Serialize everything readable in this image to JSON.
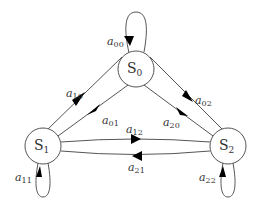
{
  "diagram": {
    "title": "",
    "colors": {
      "edge": "#555555",
      "arrowhead": "#000000",
      "label": "#333333",
      "background": "#ffffff"
    },
    "nodes": [
      {
        "id": "S0",
        "base": "S",
        "sub": "0",
        "cx": 136,
        "cy": 69,
        "r": 18
      },
      {
        "id": "S1",
        "base": "S",
        "sub": "1",
        "cx": 43,
        "cy": 146,
        "r": 18
      },
      {
        "id": "S2",
        "base": "S",
        "sub": "2",
        "cx": 228,
        "cy": 146,
        "r": 18
      }
    ],
    "edges": [
      {
        "id": "a00",
        "from": "S0",
        "to": "S0",
        "label_base": "a",
        "label_sub": "00",
        "type": "self-loop"
      },
      {
        "id": "a01",
        "from": "S0",
        "to": "S1",
        "label_base": "a",
        "label_sub": "01",
        "type": "straight"
      },
      {
        "id": "a10",
        "from": "S1",
        "to": "S0",
        "label_base": "a",
        "label_sub": "10",
        "type": "straight"
      },
      {
        "id": "a02",
        "from": "S0",
        "to": "S2",
        "label_base": "a",
        "label_sub": "02",
        "type": "straight"
      },
      {
        "id": "a20",
        "from": "S2",
        "to": "S0",
        "label_base": "a",
        "label_sub": "20",
        "type": "straight"
      },
      {
        "id": "a12",
        "from": "S1",
        "to": "S2",
        "label_base": "a",
        "label_sub": "12",
        "type": "curved"
      },
      {
        "id": "a21",
        "from": "S2",
        "to": "S1",
        "label_base": "a",
        "label_sub": "21",
        "type": "curved"
      },
      {
        "id": "a11",
        "from": "S1",
        "to": "S1",
        "label_base": "a",
        "label_sub": "11",
        "type": "self-loop"
      },
      {
        "id": "a22",
        "from": "S2",
        "to": "S2",
        "label_base": "a",
        "label_sub": "22",
        "type": "self-loop"
      }
    ]
  }
}
